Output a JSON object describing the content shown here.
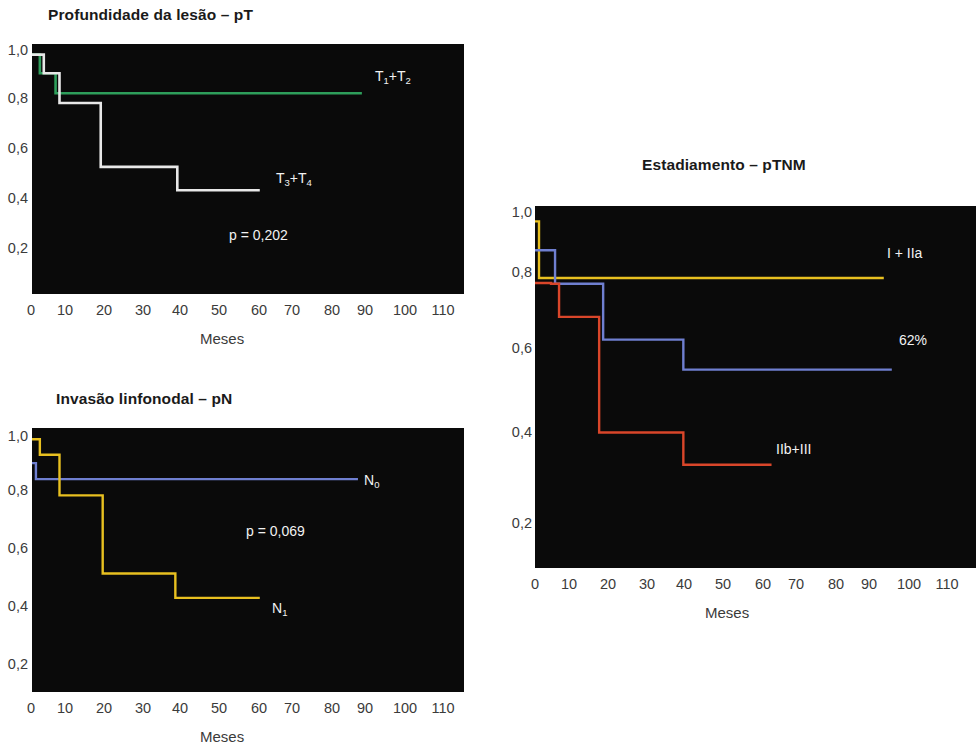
{
  "page": {
    "background": "#ffffff",
    "plot_background": "#0a0a0a",
    "axis_label": "Meses"
  },
  "chart_data": [
    {
      "id": "pt",
      "type": "line",
      "subtype": "kaplan-meier-step",
      "title": "Profundidade da lesão – pT",
      "xlabel": "Meses",
      "ylabel": "",
      "xlim": [
        0,
        110
      ],
      "ylim": [
        0.1,
        1.04
      ],
      "xticks": [
        "0",
        "10",
        "20",
        "30",
        "40",
        "50",
        "60",
        "70",
        "80",
        "90",
        "100",
        "110"
      ],
      "yticks": [
        "1,0",
        "0,8",
        "0,6",
        "0,4",
        "0,2"
      ],
      "ytick_values": [
        1.0,
        0.8,
        0.6,
        0.4,
        0.2
      ],
      "grid": false,
      "legend_position": "inline-right",
      "annotations": [
        {
          "name": "p-value",
          "text": "p = 0,202",
          "x": 52,
          "y": 0.255,
          "color": "#f2f2f2"
        }
      ],
      "series": [
        {
          "name": "T1+T2",
          "label_html": "T<sub>1</sub>+T<sub>2</sub>",
          "color": "#2e9e5b",
          "label_color": "#f2f2f2",
          "label_x": 85,
          "label_y": 0.855,
          "x": [
            0,
            2,
            2,
            6,
            6,
            84
          ],
          "y": [
            1.0,
            1.0,
            0.93,
            0.93,
            0.855,
            0.855
          ]
        },
        {
          "name": "T3+T4",
          "label_html": "T<sub>3</sub>+T<sub>4</sub>",
          "color": "#e8e8e8",
          "label_color": "#f2f2f2",
          "label_x": 62,
          "label_y": 0.5,
          "x": [
            0,
            3,
            3,
            7,
            7,
            17.5,
            17.5,
            37,
            37,
            58
          ],
          "y": [
            1.0,
            1.0,
            0.93,
            0.93,
            0.818,
            0.818,
            0.578,
            0.578,
            0.49,
            0.49
          ]
        }
      ]
    },
    {
      "id": "pn",
      "type": "line",
      "subtype": "kaplan-meier-step",
      "title": "Invasão linfonodal – pN",
      "xlabel": "Meses",
      "ylabel": "",
      "xlim": [
        0,
        110
      ],
      "ylim": [
        0.1,
        1.04
      ],
      "xticks": [
        "0",
        "10",
        "20",
        "30",
        "40",
        "50",
        "60",
        "70",
        "80",
        "90",
        "100",
        "110"
      ],
      "yticks": [
        "1,0",
        "0,8",
        "0,6",
        "0,4",
        "0,2"
      ],
      "ytick_values": [
        1.0,
        0.8,
        0.6,
        0.4,
        0.2
      ],
      "grid": false,
      "legend_position": "inline-right",
      "annotations": [
        {
          "name": "p-value",
          "text": "p = 0,069",
          "x": 52,
          "y": 0.665,
          "color": "#f2f2f2"
        }
      ],
      "series": [
        {
          "name": "N0",
          "label_html": "N<sub>0</sub>",
          "color": "#6f7fd0",
          "label_color": "#f2f2f2",
          "label_x": 84,
          "label_y": 0.855,
          "x": [
            0,
            1,
            1,
            83
          ],
          "y": [
            0.915,
            0.915,
            0.858,
            0.858
          ]
        },
        {
          "name": "N1",
          "label_html": "N<sub>1</sub>",
          "color": "#e8c020",
          "label_color": "#f2f2f2",
          "label_x": 62,
          "label_y": 0.44,
          "x": [
            0,
            2,
            2,
            7,
            7,
            18,
            18,
            36.5,
            36.5,
            58
          ],
          "y": [
            1.0,
            1.0,
            0.945,
            0.945,
            0.8,
            0.8,
            0.522,
            0.522,
            0.435,
            0.435
          ]
        }
      ]
    },
    {
      "id": "ptnm",
      "type": "line",
      "subtype": "kaplan-meier-step",
      "title": "Estadiamento – pTNM",
      "xlabel": "Meses",
      "ylabel": "",
      "xlim": [
        0,
        110
      ],
      "ylim": [
        0.1,
        1.04
      ],
      "xticks": [
        "0",
        "10",
        "20",
        "30",
        "40",
        "50",
        "60",
        "70",
        "80",
        "90",
        "100",
        "110"
      ],
      "yticks": [
        "1,0",
        "0,8",
        "0,6",
        "0,4",
        "0,2"
      ],
      "ytick_values": [
        1.0,
        0.8,
        0.6,
        0.4,
        0.2
      ],
      "grid": false,
      "legend_position": "inline-right",
      "annotations": [],
      "series": [
        {
          "name": "I + IIa",
          "label_html": "I + IIa",
          "color": "#e8c020",
          "label_color": "#f2f2f2",
          "label_x": 89,
          "label_y": 0.855,
          "x": [
            0,
            1,
            1,
            87
          ],
          "y": [
            1.0,
            1.0,
            0.853,
            0.853
          ]
        },
        {
          "name": "62%",
          "label_html": "62%",
          "color": "#6f7fd0",
          "label_color": "#f2f2f2",
          "label_x": 92,
          "label_y": 0.615,
          "x": [
            0,
            5,
            5,
            17,
            17,
            37,
            37,
            89
          ],
          "y": [
            0.925,
            0.925,
            0.838,
            0.838,
            0.693,
            0.693,
            0.615,
            0.615
          ]
        },
        {
          "name": "IIb+III",
          "label_html": "IIb+III",
          "color": "#d9462a",
          "label_color": "#f2f2f2",
          "label_x": 62,
          "label_y": 0.375,
          "x": [
            0,
            4,
            4,
            6,
            6,
            16,
            16,
            16.5,
            16.5,
            37,
            37,
            59
          ],
          "y": [
            0.84,
            0.84,
            0.838,
            0.838,
            0.752,
            0.752,
            0.452,
            0.452,
            0.452,
            0.452,
            0.368,
            0.368
          ]
        }
      ]
    }
  ]
}
